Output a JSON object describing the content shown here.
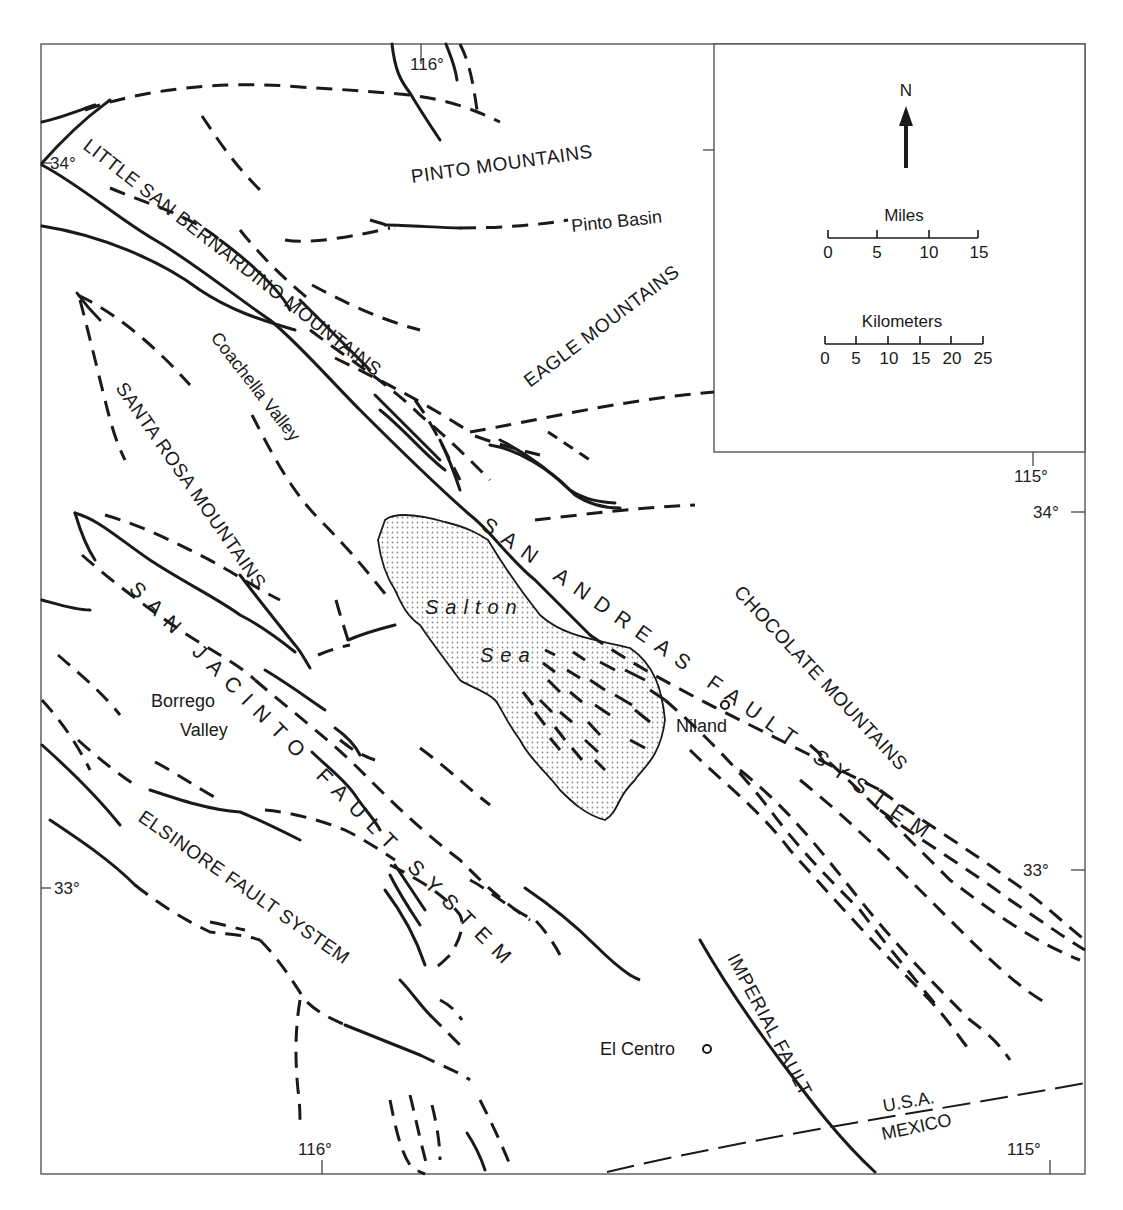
{
  "map": {
    "type": "fault map",
    "region": "Salton Trough, Southern California",
    "colors": {
      "ink": "#1a1a1a",
      "frame": "#555555",
      "background": "#ffffff",
      "sea_stipple": "#9a9a9a"
    }
  },
  "legend": {
    "north_label": "N",
    "miles": {
      "title": "Miles",
      "ticks": [
        "0",
        "5",
        "10",
        "15"
      ]
    },
    "kilometers": {
      "title": "Kilometers",
      "ticks": [
        "0",
        "5",
        "10",
        "15",
        "20",
        "25"
      ]
    }
  },
  "coordinates": {
    "lon_116_top": "116°",
    "lon_116_bottom": "116°",
    "lon_115_top": "115°",
    "lon_115_bottom": "115°",
    "lat_34_left": "34°",
    "lat_34_right": "34°",
    "lat_33_left": "33°",
    "lat_33_right": "33°"
  },
  "mountains": {
    "pinto": "PINTO MOUNTAINS",
    "little_san_bernardino": "LITTLE SAN BERNARDINO MOUNTAINS",
    "eagle": "EAGLE MOUNTAINS",
    "santa_rosa": "SANTA ROSA MOUNTAINS",
    "chocolate": "CHOCOLATE MOUNTAINS"
  },
  "faults": {
    "san_andreas": "SAN ANDREAS FAULT SYSTEM",
    "san_jacinto": "SAN JACINTO FAULT SYSTEM",
    "elsinore": "ELSINORE FAULT SYSTEM",
    "imperial": "IMPERIAL FAULT"
  },
  "places": {
    "pinto_basin": "Pinto Basin",
    "coachella_valley": "Coachella Valley",
    "borrego_valley_1": "Borrego",
    "borrego_valley_2": "Valley",
    "salton_sea_1": "Salton",
    "salton_sea_2": "Sea",
    "niland": "Niland",
    "el_centro": "El Centro"
  },
  "border": {
    "usa": "U.S.A.",
    "mexico": "MEXICO"
  }
}
